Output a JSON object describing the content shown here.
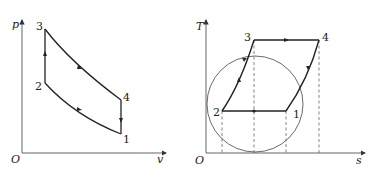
{
  "figures": [
    {
      "name": "p-v diagram",
      "axes": {
        "y_label": "p",
        "x_label": "v",
        "origin": "O"
      },
      "points": {
        "p1": "1",
        "p2": "2",
        "p3": "3",
        "p4": "4"
      },
      "processes": [
        "1→2 compression curve",
        "2→3 constant volume heat addition",
        "3→4 expansion curve",
        "4→1 constant volume heat rejection"
      ]
    },
    {
      "name": "T-s diagram",
      "axes": {
        "y_label": "T",
        "x_label": "s",
        "origin": "O"
      },
      "points": {
        "p1": "1",
        "p2": "2",
        "p3": "3",
        "p4": "4"
      },
      "processes": [
        "1→2 constant temperature",
        "2→3 inclined line",
        "3→4 constant temperature",
        "4→1 inclined line"
      ],
      "reference_circle": true
    }
  ],
  "colors": {
    "line": "#222222",
    "axis": "#555555",
    "dashed": "#666666"
  }
}
